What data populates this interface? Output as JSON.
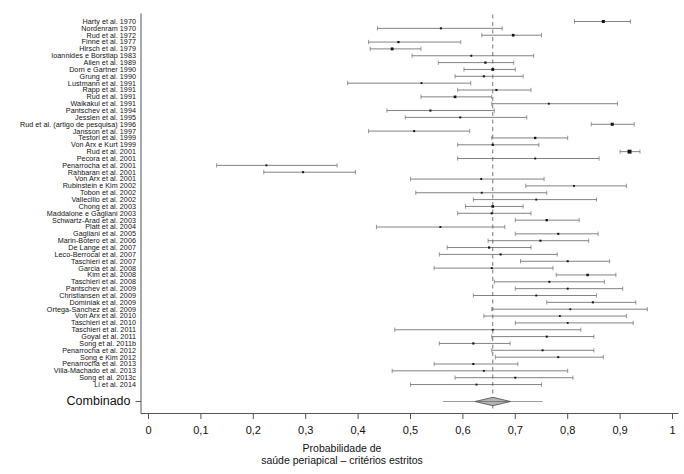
{
  "figure": {
    "type": "forest-plot",
    "summary_label": "Combinado",
    "axis_title_line1": "Probabilidade de",
    "axis_title_line2": "saúde periapical – critérios estritos"
  },
  "chart_data": {
    "type": "scatter",
    "title": "",
    "xlabel": "Probabilidade de saúde periapical – critérios estritos",
    "ylabel": "",
    "xlim": [
      0,
      1
    ],
    "xticks": [
      0,
      0.1,
      0.2,
      0.3,
      0.4,
      0.5,
      0.6,
      0.7,
      0.8,
      0.9,
      1
    ],
    "xticklabels": [
      "0",
      "0,1",
      "0,2",
      "0,3",
      "0,4",
      "0,5",
      "0,6",
      "0,7",
      "0,8",
      "0,9",
      "1"
    ],
    "grid": false,
    "legend": null,
    "reference_line": 0.657,
    "summary": {
      "label": "Combinado",
      "estimate": 0.657,
      "ci_low": 0.623,
      "ci_high": 0.691,
      "marker": "diamond"
    },
    "categories": [
      "Harty et al. 1970",
      "Nordenram 1970",
      "Rud et al. 1972",
      "Finne et al. 1977",
      "Hirsch et al. 1979",
      "Ioannides e Borstlap 1983",
      "Allen et al. 1989",
      "Dorn e Gartner 1990",
      "Grung et al. 1990",
      "Lustmann et al. 1991",
      "Rapp et al. 1991",
      "Rud et al. 1991",
      "Waikakul et al. 1991",
      "Pantschev et al. 1994",
      "Jesslen et al. 1995",
      "Rud et al. (artigo de pesquisa) 1996",
      "Jansson et al. 1997",
      "Testori et al. 1999",
      "Von Arx e Kurt 1999",
      "Rud et al. 2001",
      "Pecora et al. 2001",
      "Penarrocha et al. 2001",
      "Rahbaran et al. 2001",
      "Von Arx et al. 2001",
      "Rubinstein e Kim 2002",
      "Tobon et al. 2002",
      "Vallecillo et al. 2002",
      "Chong et al. 2003",
      "Maddalone e Gagliani 2003",
      "Schwartz-Arad et al. 2003",
      "Platt et al. 2004",
      "Gagliani et al. 2005",
      "Marin-Botero et al. 2006",
      "De Lange et al. 2007",
      "Leco-Berrocal et al. 2007",
      "Taschieri et al. 2007",
      "Garcia et al. 2008",
      "Kim et al. 2008",
      "Taschieri et al. 2008",
      "Pantschev et al. 2009",
      "Christiansen et al. 2009",
      "Dominiak et al. 2009",
      "Ortega-Sanchez et al. 2009",
      "Von Arx et al. 2010",
      "Taschieri et al. 2010",
      "Taschieri et al. 2011",
      "Goyal et al. 2011",
      "Song et al. 2011b",
      "Penarrocha et al. 2012",
      "Song e Kim 2012",
      "Penarrocha et al. 2013",
      "Villa-Machado et al. 2013",
      "Song et al. 2013c",
      "Li et al. 2014"
    ],
    "studies": [
      {
        "label": "Harty et al. 1970",
        "estimate": 0.868,
        "ci_low": 0.813,
        "ci_high": 0.92,
        "weight": 3.1
      },
      {
        "label": "Nordenram 1970",
        "estimate": 0.558,
        "ci_low": 0.437,
        "ci_high": 0.675,
        "weight": 1.1
      },
      {
        "label": "Rud et al. 1972",
        "estimate": 0.696,
        "ci_low": 0.636,
        "ci_high": 0.75,
        "weight": 2.2
      },
      {
        "label": "Finne et al. 1977",
        "estimate": 0.477,
        "ci_low": 0.42,
        "ci_high": 0.596,
        "weight": 1.4
      },
      {
        "label": "Hirsch et al. 1979",
        "estimate": 0.465,
        "ci_low": 0.423,
        "ci_high": 0.52,
        "weight": 2.8
      },
      {
        "label": "Ioannides e Borstlap 1983",
        "estimate": 0.616,
        "ci_low": 0.503,
        "ci_high": 0.735,
        "weight": 1.0
      },
      {
        "label": "Allen et al. 1989",
        "estimate": 0.643,
        "ci_low": 0.553,
        "ci_high": 0.697,
        "weight": 1.5
      },
      {
        "label": "Dorn e Gartner 1990",
        "estimate": 0.657,
        "ci_low": 0.602,
        "ci_high": 0.7,
        "weight": 2.6
      },
      {
        "label": "Grung et al. 1990",
        "estimate": 0.64,
        "ci_low": 0.585,
        "ci_high": 0.715,
        "weight": 1.2
      },
      {
        "label": "Lustmann et al. 1991",
        "estimate": 0.521,
        "ci_low": 0.38,
        "ci_high": 0.615,
        "weight": 0.9
      },
      {
        "label": "Rapp et al. 1991",
        "estimate": 0.664,
        "ci_low": 0.59,
        "ci_high": 0.73,
        "weight": 1.3
      },
      {
        "label": "Rud et al. 1991",
        "estimate": 0.585,
        "ci_low": 0.52,
        "ci_high": 0.655,
        "weight": 2.3
      },
      {
        "label": "Waikakul et al. 1991",
        "estimate": 0.764,
        "ci_low": 0.655,
        "ci_high": 0.895,
        "weight": 0.9
      },
      {
        "label": "Pantschev et al. 1994",
        "estimate": 0.538,
        "ci_low": 0.455,
        "ci_high": 0.66,
        "weight": 1.2
      },
      {
        "label": "Jesslen et al. 1995",
        "estimate": 0.595,
        "ci_low": 0.49,
        "ci_high": 0.722,
        "weight": 1.0
      },
      {
        "label": "Rud et al. (artigo de pesquisa) 1996",
        "estimate": 0.885,
        "ci_low": 0.845,
        "ci_high": 0.927,
        "weight": 3.3
      },
      {
        "label": "Jansson et al. 1997",
        "estimate": 0.507,
        "ci_low": 0.42,
        "ci_high": 0.613,
        "weight": 1.1
      },
      {
        "label": "Testori et al. 1999",
        "estimate": 0.738,
        "ci_low": 0.655,
        "ci_high": 0.8,
        "weight": 1.6
      },
      {
        "label": "Von Arx e Kurt 1999",
        "estimate": 0.657,
        "ci_low": 0.59,
        "ci_high": 0.745,
        "weight": 1.4
      },
      {
        "label": "Rud et al. 2001",
        "estimate": 0.918,
        "ci_low": 0.9,
        "ci_high": 0.938,
        "weight": 6.0
      },
      {
        "label": "Pecora et al. 2001",
        "estimate": 0.738,
        "ci_low": 0.59,
        "ci_high": 0.86,
        "weight": 0.9
      },
      {
        "label": "Penarrocha et al. 2001",
        "estimate": 0.225,
        "ci_low": 0.13,
        "ci_high": 0.36,
        "weight": 0.9
      },
      {
        "label": "Rahbaran et al. 2001",
        "estimate": 0.295,
        "ci_low": 0.22,
        "ci_high": 0.395,
        "weight": 1.1
      },
      {
        "label": "Von Arx et al. 2001",
        "estimate": 0.635,
        "ci_low": 0.5,
        "ci_high": 0.755,
        "weight": 0.9
      },
      {
        "label": "Rubinstein e Kim 2002",
        "estimate": 0.812,
        "ci_low": 0.72,
        "ci_high": 0.912,
        "weight": 0.9
      },
      {
        "label": "Tobon et al. 2002",
        "estimate": 0.636,
        "ci_low": 0.51,
        "ci_high": 0.76,
        "weight": 0.9
      },
      {
        "label": "Vallecillo et al. 2002",
        "estimate": 0.74,
        "ci_low": 0.62,
        "ci_high": 0.855,
        "weight": 0.9
      },
      {
        "label": "Chong et al. 2003",
        "estimate": 0.657,
        "ci_low": 0.605,
        "ci_high": 0.715,
        "weight": 2.2
      },
      {
        "label": "Maddalone e Gagliani 2003",
        "estimate": 0.655,
        "ci_low": 0.59,
        "ci_high": 0.73,
        "weight": 1.2
      },
      {
        "label": "Schwartz-Arad et al. 2003",
        "estimate": 0.76,
        "ci_low": 0.7,
        "ci_high": 0.822,
        "weight": 1.6
      },
      {
        "label": "Platt et al. 2004",
        "estimate": 0.557,
        "ci_low": 0.435,
        "ci_high": 0.68,
        "weight": 0.9
      },
      {
        "label": "Gagliani et al. 2005",
        "estimate": 0.782,
        "ci_low": 0.7,
        "ci_high": 0.858,
        "weight": 1.2
      },
      {
        "label": "Marin-Botero et al. 2006",
        "estimate": 0.748,
        "ci_low": 0.648,
        "ci_high": 0.84,
        "weight": 1.1
      },
      {
        "label": "De Lange et al. 2007",
        "estimate": 0.65,
        "ci_low": 0.57,
        "ci_high": 0.73,
        "weight": 1.4
      },
      {
        "label": "Leco-Berrocal et al. 2007",
        "estimate": 0.672,
        "ci_low": 0.555,
        "ci_high": 0.78,
        "weight": 1.1
      },
      {
        "label": "Taschieri et al. 2007",
        "estimate": 0.8,
        "ci_low": 0.71,
        "ci_high": 0.88,
        "weight": 1.1
      },
      {
        "label": "Garcia et al. 2008",
        "estimate": 0.655,
        "ci_low": 0.545,
        "ci_high": 0.772,
        "weight": 1.0
      },
      {
        "label": "Kim et al. 2008",
        "estimate": 0.838,
        "ci_low": 0.778,
        "ci_high": 0.892,
        "weight": 1.9
      },
      {
        "label": "Taschieri et al. 2008",
        "estimate": 0.765,
        "ci_low": 0.66,
        "ci_high": 0.87,
        "weight": 1.0
      },
      {
        "label": "Pantschev et al. 2009",
        "estimate": 0.8,
        "ci_low": 0.7,
        "ci_high": 0.905,
        "weight": 1.0
      },
      {
        "label": "Christiansen et al. 2009",
        "estimate": 0.74,
        "ci_low": 0.62,
        "ci_high": 0.855,
        "weight": 0.9
      },
      {
        "label": "Dominiak et al. 2009",
        "estimate": 0.848,
        "ci_low": 0.76,
        "ci_high": 0.93,
        "weight": 1.1
      },
      {
        "label": "Ortega-Sanchez et al. 2009",
        "estimate": 0.805,
        "ci_low": 0.655,
        "ci_high": 0.952,
        "weight": 0.8
      },
      {
        "label": "Von Arx et al. 2010",
        "estimate": 0.785,
        "ci_low": 0.64,
        "ci_high": 0.912,
        "weight": 0.8
      },
      {
        "label": "Taschieri et al. 2010",
        "estimate": 0.8,
        "ci_low": 0.7,
        "ci_high": 0.925,
        "weight": 0.8
      },
      {
        "label": "Taschieri et al. 2011",
        "estimate": 0.657,
        "ci_low": 0.47,
        "ci_high": 0.825,
        "weight": 0.7
      },
      {
        "label": "Goyal et al. 2011",
        "estimate": 0.76,
        "ci_low": 0.655,
        "ci_high": 0.85,
        "weight": 1.1
      },
      {
        "label": "Song et al. 2011b",
        "estimate": 0.62,
        "ci_low": 0.555,
        "ci_high": 0.69,
        "weight": 1.3
      },
      {
        "label": "Penarrocha et al. 2012",
        "estimate": 0.752,
        "ci_low": 0.655,
        "ci_high": 0.85,
        "weight": 1.0
      },
      {
        "label": "Song e Kim 2012",
        "estimate": 0.782,
        "ci_low": 0.662,
        "ci_high": 0.868,
        "weight": 1.0
      },
      {
        "label": "Penarrocha et al. 2013",
        "estimate": 0.62,
        "ci_low": 0.545,
        "ci_high": 0.705,
        "weight": 1.1
      },
      {
        "label": "Villa-Machado et al. 2013",
        "estimate": 0.64,
        "ci_low": 0.465,
        "ci_high": 0.8,
        "weight": 0.8
      },
      {
        "label": "Song et al. 2013c",
        "estimate": 0.7,
        "ci_low": 0.585,
        "ci_high": 0.81,
        "weight": 1.0
      },
      {
        "label": "Li et al. 2014",
        "estimate": 0.626,
        "ci_low": 0.5,
        "ci_high": 0.75,
        "weight": 0.9
      }
    ]
  },
  "colors": {
    "line": "#5a5a5a",
    "marker": "#111111",
    "axis": "#555555",
    "reference": "#777777",
    "text": "#111111"
  }
}
